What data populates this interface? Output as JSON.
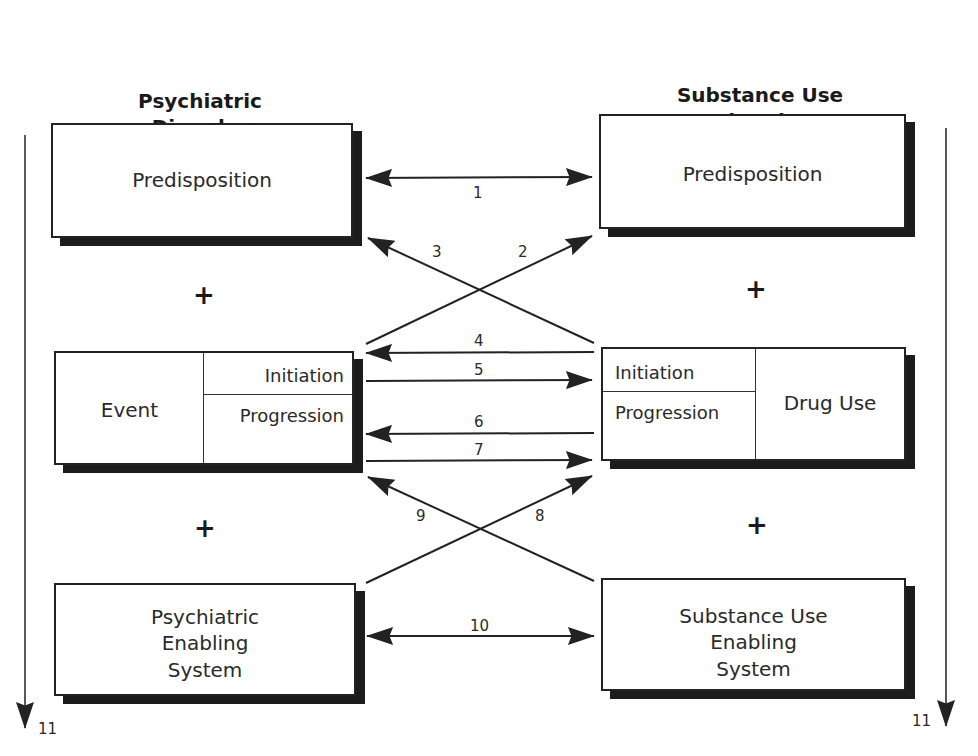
{
  "columns": {
    "left": {
      "title_line1": "Psychiatric",
      "title_line2": "Disorder"
    },
    "right": {
      "title_line1": "Substance Use",
      "title_line2": "Disorder"
    }
  },
  "left": {
    "predisposition": "Predisposition",
    "event": "Event",
    "initiation": "Initiation",
    "progression": "Progression",
    "enabling_line1": "Psychiatric",
    "enabling_line2": "Enabling",
    "enabling_line3": "System"
  },
  "right": {
    "predisposition": "Predisposition",
    "drug_use": "Drug Use",
    "initiation": "Initiation",
    "progression": "Progression",
    "enabling_line1": "Substance Use",
    "enabling_line2": "Enabling",
    "enabling_line3": "System"
  },
  "plus_symbol": "+",
  "arrow_labels": {
    "a1": "1",
    "a2": "2",
    "a3": "3",
    "a4": "4",
    "a5": "5",
    "a6": "6",
    "a7": "7",
    "a8": "8",
    "a9": "9",
    "a10": "10",
    "a11_left": "11",
    "a11_right": "11"
  },
  "colors": {
    "line": "#222222",
    "shadow": "#1c1c1c",
    "background": "#ffffff"
  }
}
